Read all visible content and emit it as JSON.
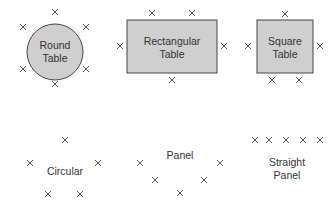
{
  "colors": {
    "table_fill": "#cfcfcf",
    "table_stroke": "#444444",
    "mark": "#444444",
    "text": "#333333"
  },
  "seat_mark_icon": "x-mark-icon",
  "tables": [
    {
      "id": "round",
      "shape": "circle",
      "label_lines": [
        "Round",
        "Table"
      ],
      "seats": [
        [
          55,
          12
        ],
        [
          23,
          27
        ],
        [
          86,
          27
        ],
        [
          23,
          69
        ],
        [
          86,
          69
        ],
        [
          55,
          84
        ]
      ]
    },
    {
      "id": "rectangular",
      "shape": "rect",
      "label_lines": [
        "Rectangular",
        "Table"
      ],
      "seats": [
        [
          152,
          13
        ],
        [
          192,
          13
        ],
        [
          120,
          46
        ],
        [
          224,
          46
        ],
        [
          172,
          80
        ]
      ]
    },
    {
      "id": "square",
      "shape": "rect",
      "label_lines": [
        "Square",
        "Table"
      ],
      "seats": [
        [
          285,
          14
        ],
        [
          248,
          46
        ],
        [
          320,
          46
        ],
        [
          272,
          80
        ],
        [
          299,
          80
        ]
      ]
    }
  ],
  "arrangements": [
    {
      "id": "circular",
      "label_lines": [
        "Circular"
      ],
      "seats": [
        [
          65,
          140
        ],
        [
          30,
          163
        ],
        [
          98,
          163
        ],
        [
          48,
          194
        ],
        [
          80,
          194
        ]
      ]
    },
    {
      "id": "panel",
      "label_lines": [
        "Panel"
      ],
      "seats": [
        [
          140,
          163
        ],
        [
          220,
          163
        ],
        [
          155,
          180
        ],
        [
          204,
          180
        ],
        [
          180,
          193
        ]
      ]
    },
    {
      "id": "straight-panel",
      "label_lines": [
        "Straight",
        "Panel"
      ],
      "seats": [
        [
          255,
          140
        ],
        [
          269,
          140
        ],
        [
          286,
          140
        ],
        [
          303,
          140
        ],
        [
          320,
          140
        ]
      ]
    }
  ]
}
